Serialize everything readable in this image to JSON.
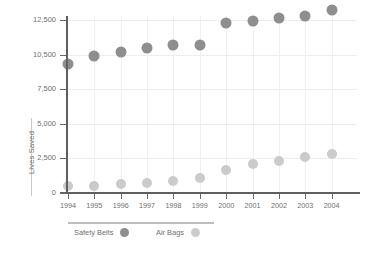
{
  "chart_data": {
    "type": "scatter",
    "title": "",
    "xlabel": "",
    "ylabel": "Lives Saved",
    "categories": [
      "1994",
      "1995",
      "1996",
      "1997",
      "1998",
      "1999",
      "2000",
      "2001",
      "2002",
      "2003",
      "2004"
    ],
    "ytick_labels": [
      "0",
      "2,500",
      "5,000",
      "7,500",
      "10,500",
      "12,500"
    ],
    "ytick_values": [
      0,
      2500,
      5000,
      7500,
      10500,
      12500
    ],
    "ylim": [
      0,
      13500
    ],
    "grid": true,
    "legend_position": "bottom-left",
    "series": [
      {
        "name": "Safety Belts",
        "color": "#8e8e8e",
        "marker": "circle",
        "values": [
          9700,
          10350,
          10650,
          10900,
          11050,
          11050,
          12350,
          12450,
          12600,
          12750,
          13100
        ]
      },
      {
        "name": "Air Bags",
        "color": "#cbcbcb",
        "marker": "circle",
        "values": [
          500,
          540,
          650,
          720,
          880,
          1050,
          1650,
          2100,
          2330,
          2600,
          2850
        ]
      }
    ]
  },
  "colors": {
    "axis": "#5f5f5f",
    "grid": "#ededed",
    "text": "#6f6f6f",
    "background": "#ffffff",
    "series_belts": "#8e8e8e",
    "series_bags": "#cbcbcb"
  }
}
